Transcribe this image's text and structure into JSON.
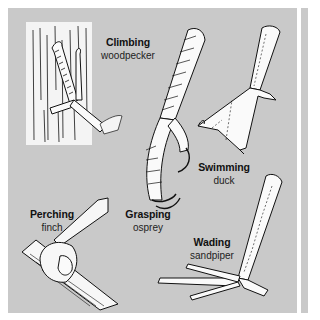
{
  "figure": {
    "background_color": "#c9c9c9",
    "labels": [
      {
        "type": "Climbing",
        "bird": "woodpecker"
      },
      {
        "type": "Swimming",
        "bird": "duck"
      },
      {
        "type": "Perching",
        "bird": "finch"
      },
      {
        "type": "Grasping",
        "bird": "osprey"
      },
      {
        "type": "Wading",
        "bird": "sandpiper"
      }
    ]
  }
}
